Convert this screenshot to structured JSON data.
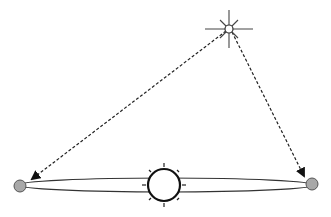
{
  "diagram": {
    "type": "astronomy-parallax",
    "background": "#ffffff",
    "line_color": "#222222",
    "planet_fill": "#a8a8a8",
    "elements": {
      "star": {
        "name": "distant-star",
        "x": 229,
        "y": 29,
        "radius": 4
      },
      "sun": {
        "name": "sun",
        "x": 164,
        "y": 185,
        "radius": 16
      },
      "orbit": {
        "name": "earth-orbit",
        "cx": 166,
        "cy": 185,
        "rx": 148,
        "ry": 7
      },
      "planet_left": {
        "name": "earth-position-1",
        "x": 20,
        "y": 186,
        "radius": 6
      },
      "planet_right": {
        "name": "earth-position-2",
        "x": 312,
        "y": 184,
        "radius": 6
      }
    },
    "sight_lines": [
      {
        "name": "sight-line-left",
        "from": "star",
        "to": "planet_left",
        "style": "dashed",
        "arrow": "end"
      },
      {
        "name": "sight-line-right",
        "from": "star",
        "to": "planet_right",
        "style": "dashed",
        "arrow": "end"
      }
    ]
  }
}
